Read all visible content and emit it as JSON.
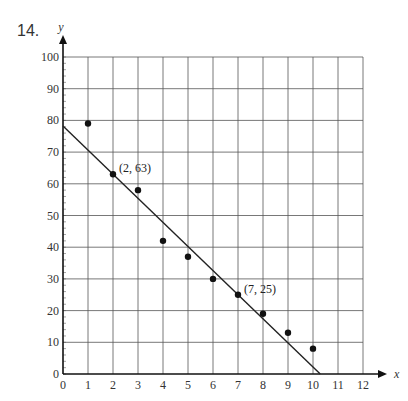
{
  "problem": {
    "number": "14."
  },
  "chart_data": {
    "type": "scatter",
    "title": "",
    "xlabel": "x",
    "ylabel": "y",
    "xlim": [
      0,
      12
    ],
    "ylim": [
      0,
      100
    ],
    "grid": true,
    "x_ticks": [
      0,
      1,
      2,
      3,
      4,
      5,
      6,
      7,
      8,
      9,
      10,
      11,
      12
    ],
    "y_ticks": [
      0,
      10,
      20,
      30,
      40,
      50,
      60,
      70,
      80,
      90,
      100
    ],
    "series": [
      {
        "name": "data points",
        "x": [
          1,
          2,
          3,
          4,
          5,
          6,
          7,
          8,
          9,
          10
        ],
        "y": [
          79,
          63,
          58,
          42,
          37,
          30,
          25,
          19,
          13,
          8
        ]
      }
    ],
    "line_of_fit": {
      "slope": -7.6,
      "intercept": 78.2,
      "x_start": 0,
      "x_end": 10.29,
      "through": [
        [
          2,
          63
        ],
        [
          7,
          25
        ]
      ]
    },
    "annotations": [
      {
        "text": "(2, 63)",
        "x": 2,
        "y": 63
      },
      {
        "text": "(7, 25)",
        "x": 7,
        "y": 25
      }
    ]
  }
}
